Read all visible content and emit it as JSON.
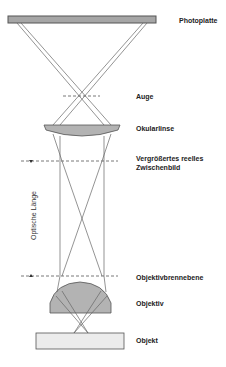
{
  "diagram": {
    "type": "optical-path-microscope",
    "colors": {
      "stroke": "#555555",
      "lens_fill": "#b3b3b3",
      "plate_fill": "#a6a6a6",
      "slide_fill": "#ececec",
      "text": "#222222"
    },
    "labels": {
      "photoplatte": "Photoplatte",
      "auge": "Auge",
      "okularlinse": "Okularlinse",
      "zwischenbild_line1": "Vergrößertes reelles",
      "zwischenbild_line2": "Zwischenbild",
      "optische_laenge": "Optische Länge",
      "objektivbrennebene": "Objektivbrennebene",
      "objektiv": "Objektiv",
      "objekt": "Objekt"
    },
    "components": [
      {
        "name": "Photoplatte",
        "y": 20
      },
      {
        "name": "Auge",
        "y": 96
      },
      {
        "name": "Okularlinse",
        "y": 128
      },
      {
        "name": "Vergrößertes reelles Zwischenbild",
        "y": 161
      },
      {
        "name": "Objektivbrennebene",
        "y": 276
      },
      {
        "name": "Objektiv",
        "y": 300
      },
      {
        "name": "Objekt",
        "y": 341
      }
    ]
  }
}
